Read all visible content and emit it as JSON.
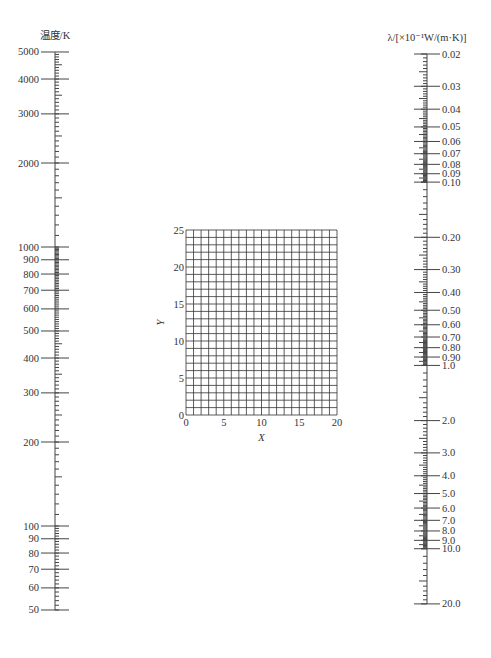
{
  "chart_data": [
    {
      "type": "nomogram-scale",
      "name": "temperature-scale",
      "title": "温度/K",
      "scale": "log",
      "range": [
        50,
        5000
      ],
      "major_ticks": [
        5000,
        4000,
        3000,
        2000,
        1000,
        900,
        800,
        700,
        600,
        500,
        400,
        300,
        200,
        100,
        90,
        80,
        70,
        60,
        50
      ],
      "tick_labels": [
        "5000",
        "4000",
        "3000",
        "2000",
        "1000",
        "900",
        "800",
        "700",
        "600",
        "500",
        "400",
        "300",
        "200",
        "100",
        "90",
        "80",
        "70",
        "60",
        "50"
      ],
      "label_side": "left"
    },
    {
      "type": "grid",
      "name": "xy-grid",
      "xlabel": "X",
      "ylabel": "Y",
      "xlim": [
        0,
        20
      ],
      "ylim": [
        0,
        25
      ],
      "x_ticks": [
        0,
        5,
        10,
        15,
        20
      ],
      "y_ticks": [
        0,
        5,
        10,
        15,
        20,
        25
      ],
      "x_grid_step": 1,
      "y_grid_step": 1,
      "grid": true
    },
    {
      "type": "nomogram-scale",
      "name": "thermal-conductivity-scale",
      "title": "λ/[×10⁻¹W/(m·K)]",
      "scale": "log",
      "range": [
        0.02,
        20.0
      ],
      "major_ticks": [
        0.02,
        0.03,
        0.04,
        0.05,
        0.06,
        0.07,
        0.08,
        0.09,
        0.1,
        0.2,
        0.3,
        0.4,
        0.5,
        0.6,
        0.7,
        0.8,
        0.9,
        1.0,
        2.0,
        3.0,
        4.0,
        5.0,
        6.0,
        7.0,
        8.0,
        9.0,
        10.0,
        20.0
      ],
      "tick_labels": [
        "0.02",
        "0.03",
        "0.04",
        "0.05",
        "0.06",
        "0.07",
        "0.08",
        "0.09",
        "0.10",
        "0.20",
        "0.30",
        "0.40",
        "0.50",
        "0.60",
        "0.70",
        "0.80",
        "0.90",
        "1.0",
        "2.0",
        "3.0",
        "4.0",
        "5.0",
        "6.0",
        "7.0",
        "8.0",
        "9.0",
        "10.0",
        "20.0"
      ],
      "label_side": "right"
    }
  ],
  "layout": {
    "left_axis": {
      "x": 55,
      "y_ref": 247,
      "ref_value": 1000,
      "px_per_decade": 279,
      "top_value": 5000,
      "bottom_value": 50
    },
    "right_axis": {
      "x": 427,
      "y_ref": 54,
      "ref_value": 0.02,
      "px_per_decade": 183.3,
      "top_value": 0.02,
      "bottom_value": 20.0
    },
    "grid": {
      "left": 186,
      "top": 230,
      "width": 151,
      "height": 185,
      "cols": 20,
      "rows": 25
    }
  }
}
